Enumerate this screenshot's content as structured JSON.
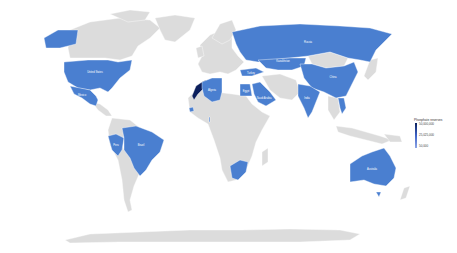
{
  "map": {
    "type": "choropleth",
    "projection": "miller",
    "base_land_color": "#dcdcdc",
    "background_color": "#ffffff",
    "highlight_color": "#4a7fd0",
    "max_color": "#0b1f5c"
  },
  "legend": {
    "title": "Phosphate reserves",
    "ticks": [
      "50,000,000",
      "25,025,000",
      "50,000"
    ],
    "gradient": [
      "#0b1f5c",
      "#3f63c7",
      "#8fa6e6"
    ]
  },
  "countries": [
    {
      "name": "United States",
      "label": "United States",
      "color": "#4a7fd0"
    },
    {
      "name": "Mexico",
      "label": "Mexico",
      "color": "#4a7fd0"
    },
    {
      "name": "Peru",
      "label": "Peru",
      "color": "#4a7fd0"
    },
    {
      "name": "Brazil",
      "label": "Brazil",
      "color": "#4a7fd0"
    },
    {
      "name": "Morocco",
      "label": "",
      "color": "#0b1f5c"
    },
    {
      "name": "Algeria",
      "label": "Algeria",
      "color": "#4a7fd0"
    },
    {
      "name": "Senegal",
      "label": "",
      "color": "#4a7fd0"
    },
    {
      "name": "Togo",
      "label": "",
      "color": "#4a7fd0"
    },
    {
      "name": "Egypt",
      "label": "Egypt",
      "color": "#4a7fd0"
    },
    {
      "name": "Saudi Arabia",
      "label": "Saudi Arabia",
      "color": "#4a7fd0"
    },
    {
      "name": "Turkey",
      "label": "Turkey",
      "color": "#4a7fd0"
    },
    {
      "name": "South Africa",
      "label": "",
      "color": "#4a7fd0"
    },
    {
      "name": "Russia",
      "label": "Russia",
      "color": "#4a7fd0"
    },
    {
      "name": "Kazakhstan",
      "label": "Kazakhstan",
      "color": "#4a7fd0"
    },
    {
      "name": "China",
      "label": "China",
      "color": "#4a7fd0"
    },
    {
      "name": "India",
      "label": "India",
      "color": "#4a7fd0"
    },
    {
      "name": "Vietnam",
      "label": "",
      "color": "#4a7fd0"
    },
    {
      "name": "Australia",
      "label": "Australia",
      "color": "#4a7fd0"
    }
  ],
  "labels": {
    "usa": "United States",
    "mexico": "Mexico",
    "peru": "Peru",
    "brazil": "Brazil",
    "algeria": "Algeria",
    "egypt": "Egypt",
    "saudi": "Saudi Arabia",
    "turkey": "Turkey",
    "russia": "Russia",
    "kazakhstan": "Kazakhstan",
    "china": "China",
    "india": "India",
    "australia": "Australia"
  }
}
